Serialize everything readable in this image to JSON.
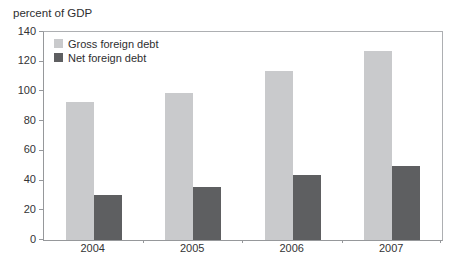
{
  "chart_data": {
    "type": "bar",
    "title": "percent of GDP",
    "categories": [
      "2004",
      "2005",
      "2006",
      "2007"
    ],
    "series": [
      {
        "name": "Gross foreign debt",
        "color": "#c9cacc",
        "values": [
          93,
          99,
          114,
          127
        ]
      },
      {
        "name": "Net foreign debt",
        "color": "#5e5f61",
        "values": [
          30,
          36,
          44,
          50
        ]
      }
    ],
    "ylim": [
      0,
      140
    ],
    "yticks": [
      0,
      20,
      40,
      60,
      80,
      100,
      120,
      140
    ],
    "xlabel": "",
    "ylabel": "",
    "legend_position": "top-left",
    "grid": false,
    "colors": {
      "frame": "#adafb2",
      "axis": "#96989b",
      "text": "#2e2e30"
    }
  }
}
